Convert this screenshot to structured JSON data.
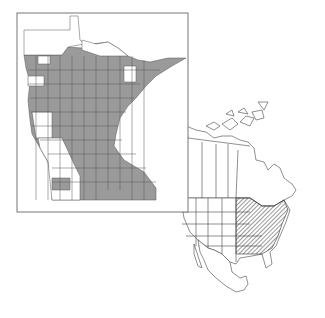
{
  "figure": {
    "type": "range-map",
    "inset_state_map": {
      "region": "Minnesota counties",
      "frame": {
        "x": 17,
        "y": 13,
        "width": 171,
        "height": 199
      },
      "colors": {
        "present": "#9a9a9a",
        "absent": "#ffffff",
        "border": "#555555",
        "frame": "#777777"
      },
      "legend": "gray = county present, white = county absent"
    },
    "continent_map": {
      "region": "North America",
      "range_fill": "hatched",
      "range_area": "eastern United States and southeastern Canada",
      "colors": {
        "outline": "#444444",
        "hatch": "#333333",
        "land": "#ffffff"
      }
    }
  }
}
